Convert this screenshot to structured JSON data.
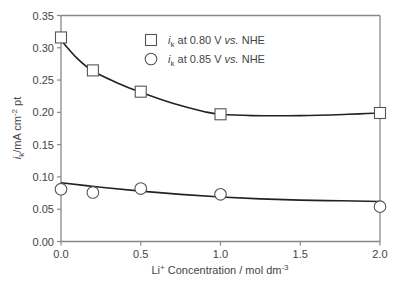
{
  "chart_data": {
    "type": "scatter",
    "title": "",
    "xlabel": "Li+ Concentration / mol dm-3",
    "xlabel_parts": {
      "base": "Li",
      "sup": "+",
      "rest": " Concentration / mol dm",
      "sup2": "-3"
    },
    "ylabel": "ik/mA cm-2 pt",
    "ylabel_parts": {
      "i": "i",
      "sub": "k",
      "rest": "/mA cm",
      "sup": "-2",
      "tail": " pt"
    },
    "xlim": [
      0.0,
      2.0
    ],
    "ylim": [
      0.0,
      0.35
    ],
    "xticks": [
      0.0,
      0.5,
      1.0,
      1.5,
      2.0
    ],
    "xtick_labels": [
      "0.0",
      "0.5",
      "1.0",
      "1.5",
      "2.0"
    ],
    "yticks": [
      0.0,
      0.05,
      0.1,
      0.15,
      0.2,
      0.25,
      0.3,
      0.35
    ],
    "ytick_labels": [
      "0.00",
      "0.05",
      "0.10",
      "0.15",
      "0.20",
      "0.25",
      "0.30",
      "0.35"
    ],
    "grid": false,
    "legend_position": "upper right",
    "series": [
      {
        "name": "ik at 0.80 V vs. NHE",
        "legend": {
          "i": "i",
          "sub": "k",
          "mid": " at 0.80 V ",
          "it": "vs.",
          "end": " NHE"
        },
        "marker": "square",
        "x": [
          0.0,
          0.2,
          0.5,
          1.0,
          2.0
        ],
        "values": [
          0.316,
          0.265,
          0.232,
          0.197,
          0.199
        ],
        "fit_curve": {
          "x": [
            0.0,
            0.1,
            0.2,
            0.35,
            0.5,
            0.7,
            0.9,
            1.0,
            1.2,
            1.5,
            1.8,
            2.0
          ],
          "y": [
            0.312,
            0.284,
            0.264,
            0.246,
            0.231,
            0.214,
            0.201,
            0.197,
            0.195,
            0.195,
            0.197,
            0.199
          ]
        }
      },
      {
        "name": "ik at 0.85 V vs. NHE",
        "legend": {
          "i": "i",
          "sub": "k",
          "mid": " at 0.85 V ",
          "it": "vs.",
          "end": " NHE"
        },
        "marker": "circle",
        "x": [
          0.0,
          0.2,
          0.5,
          1.0,
          2.0
        ],
        "values": [
          0.081,
          0.076,
          0.082,
          0.073,
          0.054
        ],
        "fit_curve": {
          "x": [
            0.0,
            0.25,
            0.5,
            0.75,
            1.0,
            1.25,
            1.5,
            1.75,
            2.0
          ],
          "y": [
            0.091,
            0.084,
            0.078,
            0.073,
            0.069,
            0.066,
            0.064,
            0.063,
            0.062
          ]
        }
      }
    ]
  },
  "layout": {
    "plot_left": 61,
    "plot_right": 380,
    "plot_top": 15.5,
    "plot_bottom": 241.5,
    "axis_color": "#888888",
    "line_color": "#222222",
    "marker_stroke": "#555555"
  }
}
